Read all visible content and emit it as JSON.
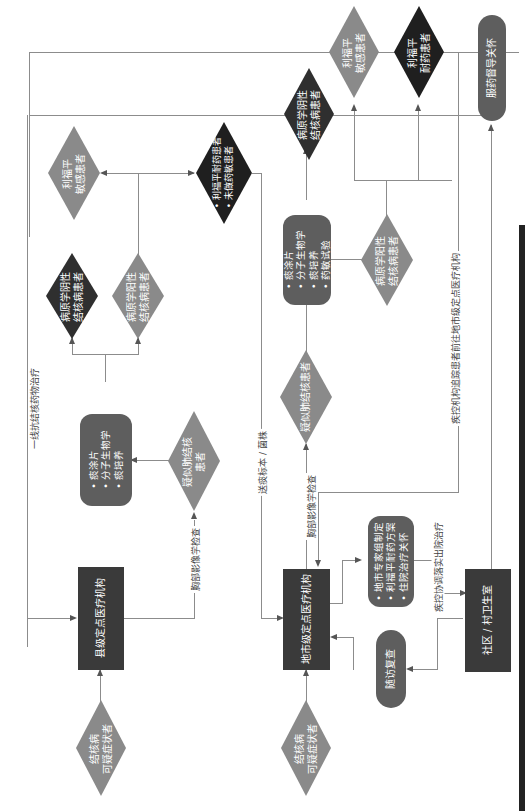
{
  "diagram": {
    "orientation": "rotated-90-ccw",
    "colors": {
      "dark": "#2f2f2f",
      "mid": "#5e5e5e",
      "light": "#8a8a8a",
      "line": "#8c8c8c"
    },
    "nodes": {
      "start_county": {
        "line1": "结核病",
        "line2": "可疑症状者"
      },
      "county_facility": {
        "label": "县级定点医疗机构"
      },
      "suspected_county": {
        "line1": "疑似肺结核",
        "line2": "患者"
      },
      "tests_county": {
        "items": [
          "痰涂片",
          "分子生物学",
          "痰培养"
        ]
      },
      "neg_county": {
        "line1": "病原学阴性",
        "line2": "结核病患者"
      },
      "pos_county": {
        "line1": "病原学阳性",
        "line2": "结核病患者"
      },
      "rif_sens_county": {
        "line1": "利福平",
        "line2": "敏感患者"
      },
      "rif_res_county": {
        "items": [
          "利福平耐药患者",
          "未做药敏患者"
        ]
      },
      "start_city": {
        "line1": "结核病",
        "line2": "可疑症状者"
      },
      "city_facility": {
        "label": "地市级定点医疗机构"
      },
      "suspected_city": {
        "label": "疑似肺结核患者"
      },
      "tests_city": {
        "items": [
          "痰涂片",
          "分子生物学",
          "痰培养",
          "药敏试验"
        ]
      },
      "neg_city": {
        "line1": "病原学阴性",
        "line2": "结核病患者"
      },
      "pos_city": {
        "line1": "病原学阳性",
        "line2": "结核病患者"
      },
      "rif_sens_city": {
        "line1": "利福平",
        "line2": "敏感患者"
      },
      "rif_res_city": {
        "line1": "利福平",
        "line2": "耐药患者"
      },
      "expert_group": {
        "items": [
          "地市专家组制定",
          "利福平耐药方案",
          "住院治疗关怀"
        ]
      },
      "followup": {
        "label": "随访复查"
      },
      "community": {
        "label": "社区 / 村卫生室"
      },
      "service": {
        "label": "服药督导关怀"
      }
    },
    "edge_labels": {
      "first_line": "一线抗结核药物治疗",
      "chest_imaging_county": "胸部影像学检查",
      "send_specimen": "送痰标本 / 菌株",
      "chest_imaging_city": "胸部影像学检查",
      "cdc_track": "疾控机构追踪患者前往地市级定点医疗机构",
      "cdc_coordinate": "疾控协调落实出院治疗"
    }
  }
}
